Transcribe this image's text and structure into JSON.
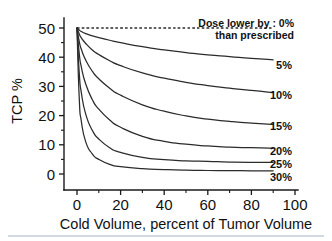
{
  "chart_data": {
    "type": "line",
    "title": "",
    "xlabel": "Cold Volume, percent of Tumor Volume",
    "ylabel": "TCP %",
    "xlim": [
      0,
      100
    ],
    "ylim": [
      0,
      50
    ],
    "grid": false,
    "legend_position": "right-inline-labels",
    "xticks": [
      "0",
      "20",
      "40",
      "60",
      "80",
      "100"
    ],
    "xtick_values": [
      0,
      20,
      40,
      60,
      80,
      100
    ],
    "yticks": [
      "0",
      "10",
      "20",
      "30",
      "40",
      "50"
    ],
    "ytick_values": [
      0,
      10,
      20,
      30,
      40,
      50
    ],
    "x_minor_step": 10,
    "y_minor_step": 5,
    "annotation_lines": [
      "Dose lower by : 0%",
      "than prescribed"
    ],
    "series": [
      {
        "name": "0%",
        "label": "0%",
        "style": "dashed",
        "x": [
          0,
          5,
          10,
          20,
          30,
          40,
          50,
          60,
          70,
          80,
          90
        ],
        "values": [
          50,
          50,
          50,
          50,
          50,
          50,
          50,
          50,
          50,
          50,
          50
        ]
      },
      {
        "name": "5%",
        "label": "5%",
        "style": "solid",
        "x": [
          0,
          1,
          2,
          4,
          7,
          10,
          15,
          20,
          30,
          40,
          50,
          60,
          70,
          80,
          90
        ],
        "values": [
          50,
          49.3,
          48.8,
          48.1,
          47.3,
          46.7,
          45.8,
          45.0,
          43.6,
          42.5,
          41.6,
          40.8,
          40.2,
          39.6,
          39.1
        ]
      },
      {
        "name": "10%",
        "label": "10%",
        "style": "solid",
        "x": [
          0,
          1,
          2,
          4,
          7,
          10,
          15,
          20,
          30,
          40,
          50,
          60,
          70,
          80,
          90
        ],
        "values": [
          50,
          48.0,
          46.6,
          44.7,
          42.5,
          40.9,
          38.8,
          37.1,
          34.6,
          32.8,
          31.4,
          30.3,
          29.4,
          28.6,
          27.9
        ]
      },
      {
        "name": "15%",
        "label": "15%",
        "style": "solid",
        "x": [
          0,
          1,
          2,
          4,
          7,
          10,
          15,
          20,
          30,
          40,
          50,
          60,
          70,
          80,
          90
        ],
        "values": [
          50,
          45.5,
          42.7,
          39.0,
          35.2,
          32.6,
          29.4,
          27.0,
          23.7,
          21.5,
          19.9,
          18.8,
          18.0,
          17.4,
          17.0
        ]
      },
      {
        "name": "20%",
        "label": "20%",
        "style": "solid",
        "x": [
          0,
          1,
          2,
          4,
          7,
          10,
          15,
          20,
          30,
          40,
          50,
          60,
          70,
          80,
          90
        ],
        "values": [
          50,
          41.5,
          36.6,
          30.8,
          25.5,
          22.2,
          18.5,
          16.0,
          12.9,
          11.2,
          10.2,
          9.6,
          9.2,
          9.0,
          8.8
        ]
      },
      {
        "name": "25%",
        "label": "25%",
        "style": "solid",
        "x": [
          0,
          1,
          2,
          4,
          7,
          10,
          15,
          20,
          30,
          40,
          50,
          60,
          70,
          80,
          90
        ],
        "values": [
          50,
          35.0,
          27.8,
          20.5,
          15.0,
          12.0,
          9.0,
          7.4,
          5.7,
          4.9,
          4.5,
          4.3,
          4.1,
          4.0,
          4.0
        ]
      },
      {
        "name": "30%",
        "label": "30%",
        "style": "solid",
        "x": [
          0,
          1,
          2,
          4,
          7,
          10,
          15,
          20,
          30,
          40,
          50,
          60,
          70,
          80,
          90
        ],
        "values": [
          50,
          26.5,
          18.0,
          11.0,
          6.9,
          5.0,
          3.3,
          2.5,
          1.8,
          1.5,
          1.3,
          1.2,
          1.15,
          1.1,
          1.1
        ]
      }
    ]
  }
}
